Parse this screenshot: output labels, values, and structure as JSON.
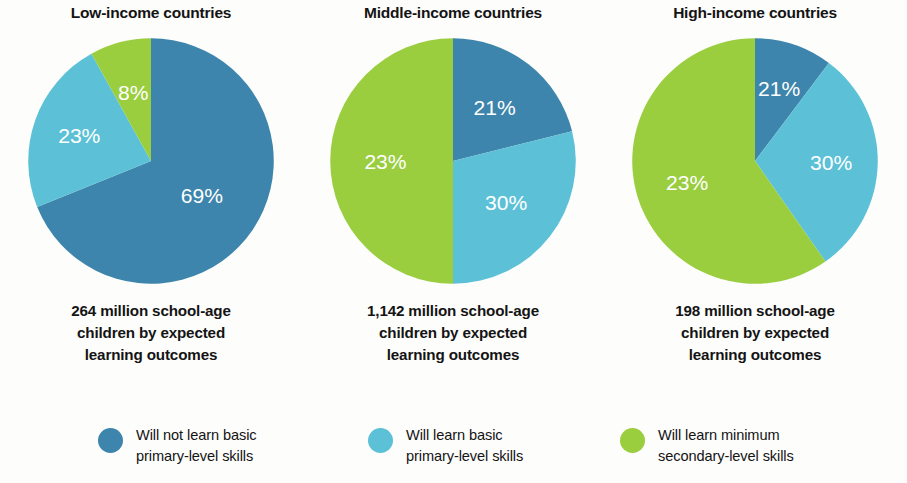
{
  "chart_data": {
    "type": "pie",
    "title": "School-age children by expected learning outcomes",
    "legend_position": "bottom",
    "colors": {
      "will_not_learn_basic_primary": "#3d85ac",
      "will_learn_basic_primary": "#5cc1d7",
      "will_learn_minimum_secondary": "#9ace3f"
    },
    "legend": [
      {
        "key": "will_not_learn_basic_primary",
        "color": "#3d85ac",
        "line1": "Will not learn basic",
        "line2": "primary-level skills"
      },
      {
        "key": "will_learn_basic_primary",
        "color": "#5cc1d7",
        "line1": "Will learn basic",
        "line2": "primary-level skills"
      },
      {
        "key": "will_learn_minimum_secondary",
        "color": "#9ace3f",
        "line1": "Will learn minimum",
        "line2": "secondary-level skills"
      }
    ],
    "panels": [
      {
        "title": "Low-income countries",
        "caption_line1": "264 million school-age",
        "caption_line2": "children by expected",
        "caption_line3": "learning outcomes",
        "total_millions": 264,
        "categories": [
          "Will not learn basic primary-level skills",
          "Will learn basic primary-level skills",
          "Will learn minimum secondary-level skills"
        ],
        "values": [
          69,
          23,
          8
        ],
        "labels": [
          "69%",
          "23%",
          "8%"
        ],
        "wedges": [
          {
            "color": "#3d85ac",
            "start_deg": 0,
            "end_deg": 248,
            "label": "69%",
            "label_r": 0.5
          },
          {
            "color": "#5cc1d7",
            "start_deg": 248,
            "end_deg": 331,
            "label": "23%",
            "label_r": 0.62
          },
          {
            "color": "#9ace3f",
            "start_deg": 331,
            "end_deg": 360,
            "label": "8%",
            "label_r": 0.58
          }
        ]
      },
      {
        "title": "Middle-income countries",
        "caption_line1": "1,142 million school-age",
        "caption_line2": "children by expected",
        "caption_line3": "learning outcomes",
        "total_millions": 1142,
        "categories": [
          "Will not learn basic primary-level skills",
          "Will learn basic primary-level skills",
          "Will learn minimum secondary-level skills"
        ],
        "values": [
          21,
          30,
          23
        ],
        "labels": [
          "21%",
          "30%",
          "23%"
        ],
        "wedges": [
          {
            "color": "#3d85ac",
            "start_deg": 0,
            "end_deg": 76,
            "label": "21%",
            "label_r": 0.55
          },
          {
            "color": "#5cc1d7",
            "start_deg": 76,
            "end_deg": 180,
            "label": "30%",
            "label_r": 0.55
          },
          {
            "color": "#9ace3f",
            "start_deg": 180,
            "end_deg": 360,
            "label": "23%",
            "label_r": 0.55
          }
        ]
      },
      {
        "title": "High-income countries",
        "caption_line1": "198 million school-age",
        "caption_line2": "children by expected",
        "caption_line3": "learning outcomes",
        "total_millions": 198,
        "categories": [
          "Will not learn basic primary-level skills",
          "Will learn basic primary-level skills",
          "Will learn minimum secondary-level skills"
        ],
        "values": [
          21,
          30,
          23
        ],
        "labels": [
          "21%",
          "30%",
          "23%"
        ],
        "wedges": [
          {
            "color": "#3d85ac",
            "start_deg": 0,
            "end_deg": 37,
            "label": "21%",
            "label_r": 0.62
          },
          {
            "color": "#5cc1d7",
            "start_deg": 37,
            "end_deg": 145,
            "label": "30%",
            "label_r": 0.62
          },
          {
            "color": "#9ace3f",
            "start_deg": 145,
            "end_deg": 360,
            "label": "23%",
            "label_r": 0.58
          }
        ]
      }
    ]
  }
}
